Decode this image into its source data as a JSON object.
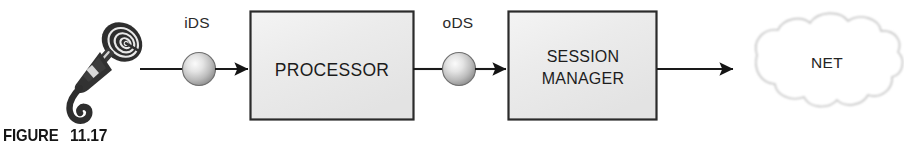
{
  "figure": {
    "caption_word": "FIGURE",
    "caption_number": "11.17"
  },
  "diagram": {
    "type": "signal-flow-block-diagram",
    "source_icon": "microphone-icon",
    "nodes": [
      {
        "id": "microphone",
        "kind": "icon",
        "label": ""
      },
      {
        "id": "ids",
        "kind": "sphere",
        "label": "iDS"
      },
      {
        "id": "processor",
        "kind": "box",
        "label": "PROCESSOR"
      },
      {
        "id": "ods",
        "kind": "sphere",
        "label": "oDS"
      },
      {
        "id": "session_manager",
        "kind": "box",
        "label_line1": "SESSION",
        "label_line2": "MANAGER"
      },
      {
        "id": "net",
        "kind": "cloud",
        "label": "NET"
      }
    ],
    "edges": [
      {
        "from": "microphone",
        "to": "ids",
        "arrow": false
      },
      {
        "from": "ids",
        "to": "processor",
        "arrow": true
      },
      {
        "from": "processor",
        "to": "ods",
        "arrow": false
      },
      {
        "from": "ods",
        "to": "session_manager",
        "arrow": true
      },
      {
        "from": "session_manager",
        "to": "net",
        "arrow": true
      }
    ],
    "colors": {
      "box_fill": "#ececec",
      "box_border": "#2b2b2b",
      "sphere_light": "#f2f2f2",
      "sphere_dark": "#8d8d8d",
      "line": "#1a1a1a",
      "cloud_outline": "#c9c9c9",
      "cloud_fill": "#ffffff",
      "text": "#1b1b1b"
    }
  }
}
